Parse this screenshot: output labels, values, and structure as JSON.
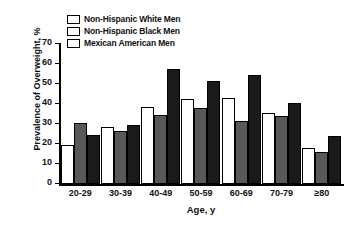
{
  "chart_data": {
    "type": "bar",
    "title": "",
    "xlabel": "Age, y",
    "ylabel": "Prevalence of Overweight, %",
    "ylim": [
      0,
      70
    ],
    "yticks": [
      0,
      10,
      20,
      30,
      40,
      50,
      60,
      70
    ],
    "grid": false,
    "legend_position": "top-left-inside",
    "categories": [
      "20-29",
      "30-39",
      "40-49",
      "50-59",
      "60-69",
      "70-79",
      "≥80"
    ],
    "series": [
      {
        "name": "Non-Hispanic White Men",
        "color": "#ffffff",
        "values": [
          19.5,
          28.5,
          38.5,
          42.5,
          43.0,
          35.5,
          18.0
        ]
      },
      {
        "name": "Non-Hispanic Black Men",
        "color": "#58585a",
        "values": [
          30.5,
          26.5,
          34.5,
          38.0,
          31.5,
          34.0,
          16.0
        ]
      },
      {
        "name": "Mexican American Men",
        "color": "#1a1a1a",
        "values": [
          24.5,
          29.5,
          57.5,
          51.5,
          54.5,
          40.5,
          24.0
        ]
      }
    ]
  }
}
